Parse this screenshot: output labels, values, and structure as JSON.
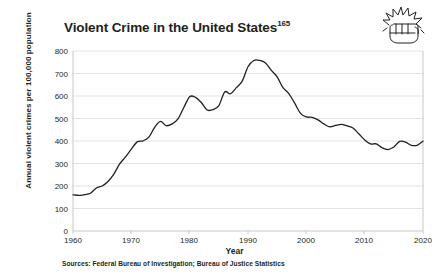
{
  "title": {
    "text": "Violent Crime in the United States",
    "footnote": "165"
  },
  "icon": {
    "name": "fist-impact-icon"
  },
  "axes": {
    "y_title": "Annual violent crimes per 100,000 population",
    "x_title": "Year",
    "y_ticks": [
      "800",
      "700",
      "600",
      "500",
      "400",
      "300",
      "200",
      "100",
      "0"
    ],
    "x_ticks": [
      "1960",
      "1970",
      "1980",
      "1990",
      "2000",
      "2010",
      "2020"
    ]
  },
  "source_note": "Sources: Federal Bureau of Investigation; Bureau of Justice Statistics",
  "colors": {
    "line": "#231f20",
    "gridline": "#d7d7d9",
    "axis": "#b9b9bb",
    "text": "#231f20",
    "background": "#ffffff"
  },
  "chart_data": {
    "type": "line",
    "title": "Violent Crime in the United States",
    "xlabel": "Year",
    "ylabel": "Annual violent crimes per 100,000 population",
    "xlim": [
      1960,
      2020
    ],
    "ylim": [
      0,
      800
    ],
    "grid": true,
    "legend": "none",
    "ytick_interval": 100,
    "xtick_interval": 10,
    "series": [
      {
        "name": "Violent crime rate",
        "x": [
          1960,
          1961,
          1962,
          1963,
          1964,
          1965,
          1966,
          1967,
          1968,
          1969,
          1970,
          1971,
          1972,
          1973,
          1974,
          1975,
          1976,
          1977,
          1978,
          1979,
          1980,
          1981,
          1982,
          1983,
          1984,
          1985,
          1986,
          1987,
          1988,
          1989,
          1990,
          1991,
          1992,
          1993,
          1994,
          1995,
          1996,
          1997,
          1998,
          1999,
          2000,
          2001,
          2002,
          2003,
          2004,
          2005,
          2006,
          2007,
          2008,
          2009,
          2010,
          2011,
          2012,
          2013,
          2014,
          2015,
          2016,
          2017,
          2018,
          2019,
          2020
        ],
        "values": [
          161,
          158,
          162,
          168,
          191,
          200,
          220,
          253,
          298,
          329,
          364,
          396,
          401,
          417,
          461,
          487,
          468,
          476,
          498,
          549,
          597,
          594,
          571,
          538,
          539,
          557,
          618,
          610,
          637,
          666,
          730,
          758,
          758,
          747,
          714,
          685,
          637,
          611,
          568,
          523,
          507,
          505,
          494,
          476,
          463,
          469,
          474,
          467,
          458,
          432,
          405,
          387,
          387,
          370,
          362,
          373,
          398,
          395,
          381,
          381,
          399
        ]
      }
    ],
    "annotations": [
      {
        "label": "peak",
        "x": 1991,
        "y": 758
      },
      {
        "label": "start",
        "x": 1960,
        "y": 161
      },
      {
        "label": "end",
        "x": 2020,
        "y": 399
      }
    ]
  }
}
